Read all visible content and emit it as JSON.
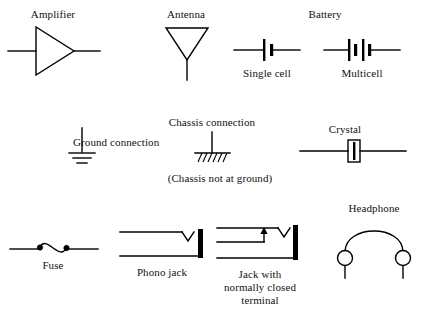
{
  "figure": {
    "background_color": "#ffffff",
    "ink_color": "#000000",
    "width": 421,
    "height": 318
  },
  "symbols": {
    "amplifier": {
      "label": "Amplifier",
      "icon": "amplifier-triangle-icon"
    },
    "antenna": {
      "label": "Antenna",
      "icon": "antenna-triangle-icon"
    },
    "battery": {
      "group_label": "Battery",
      "single_cell_label": "Single cell",
      "multicell_label": "Multicell",
      "single_cell_icon": "battery-single-cell-icon",
      "multicell_icon": "battery-multicell-icon"
    },
    "ground": {
      "label": "Ground connection",
      "icon": "ground-connection-icon"
    },
    "chassis": {
      "label": "Chassis connection",
      "note": "(Chassis not at ground)",
      "icon": "chassis-connection-icon"
    },
    "crystal": {
      "label": "Crystal",
      "icon": "crystal-icon"
    },
    "fuse": {
      "label": "Fuse",
      "icon": "fuse-icon"
    },
    "phono_jack": {
      "label": "Phono jack",
      "icon": "phono-jack-icon"
    },
    "closed_jack": {
      "label_line1": "Jack with",
      "label_line2": "normally closed",
      "label_line3": "terminal",
      "icon": "jack-normally-closed-icon"
    },
    "headphone": {
      "label": "Headphone",
      "icon": "headphone-icon"
    }
  }
}
